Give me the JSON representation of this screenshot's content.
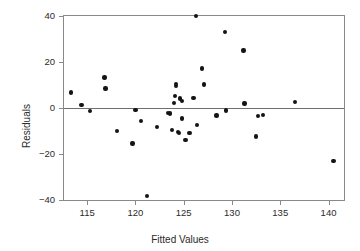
{
  "chart_data": {
    "type": "scatter",
    "title": "",
    "xlabel": "Fitted Values",
    "ylabel": "Residuals",
    "xlim": [
      112.6,
      141.6
    ],
    "ylim": [
      -40,
      40
    ],
    "xticks": [
      115,
      120,
      125,
      130,
      135,
      140
    ],
    "yticks": [
      40,
      20,
      0,
      -20,
      -40
    ],
    "grid": false,
    "legend": null,
    "reference_line": {
      "y": 0,
      "color": "#6f6f6f"
    },
    "marker": {
      "shape": "circle",
      "color": "#141414",
      "size": 4.4
    },
    "points": [
      {
        "x": 113.3,
        "y": 6.8
      },
      {
        "x": 114.4,
        "y": 1.4
      },
      {
        "x": 115.3,
        "y": -1.2
      },
      {
        "x": 116.8,
        "y": 13.2
      },
      {
        "x": 116.9,
        "y": 8.4
      },
      {
        "x": 118.1,
        "y": -10.0
      },
      {
        "x": 119.7,
        "y": -15.5
      },
      {
        "x": 120.0,
        "y": -0.8
      },
      {
        "x": 120.6,
        "y": -5.7
      },
      {
        "x": 121.2,
        "y": -38.2
      },
      {
        "x": 122.2,
        "y": -8.3
      },
      {
        "x": 123.4,
        "y": -2.3
      },
      {
        "x": 123.6,
        "y": -2.4
      },
      {
        "x": 123.8,
        "y": -9.6
      },
      {
        "x": 124.0,
        "y": 2.2
      },
      {
        "x": 124.1,
        "y": 5.3
      },
      {
        "x": 124.2,
        "y": 9.6
      },
      {
        "x": 124.2,
        "y": 10.4
      },
      {
        "x": 124.4,
        "y": -10.3
      },
      {
        "x": 124.5,
        "y": -10.9
      },
      {
        "x": 124.6,
        "y": 4.2
      },
      {
        "x": 124.8,
        "y": 3.0
      },
      {
        "x": 124.8,
        "y": -4.6
      },
      {
        "x": 125.2,
        "y": -14.0
      },
      {
        "x": 125.6,
        "y": -10.8
      },
      {
        "x": 126.0,
        "y": 4.4
      },
      {
        "x": 126.3,
        "y": 40.0
      },
      {
        "x": 126.4,
        "y": -7.3
      },
      {
        "x": 126.9,
        "y": 17.1
      },
      {
        "x": 127.1,
        "y": 10.2
      },
      {
        "x": 128.4,
        "y": -3.2
      },
      {
        "x": 129.3,
        "y": 33.0
      },
      {
        "x": 129.4,
        "y": -1.1
      },
      {
        "x": 131.2,
        "y": 25.0
      },
      {
        "x": 131.3,
        "y": 1.9
      },
      {
        "x": 132.5,
        "y": -12.4
      },
      {
        "x": 132.7,
        "y": -3.4
      },
      {
        "x": 133.2,
        "y": -3.0
      },
      {
        "x": 136.5,
        "y": 2.7
      },
      {
        "x": 140.5,
        "y": -23.0
      }
    ]
  }
}
